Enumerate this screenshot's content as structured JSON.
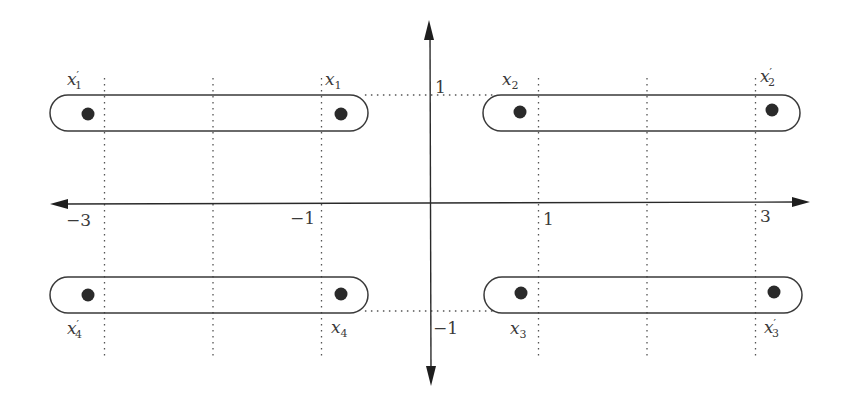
{
  "diagram": {
    "type": "coordinate-plane-pairing",
    "axes": {
      "x_ticks": [
        {
          "value": -3,
          "label": "−3"
        },
        {
          "value": -1,
          "label": "−1"
        },
        {
          "value": 1,
          "label": "1"
        },
        {
          "value": 3,
          "label": "3"
        }
      ],
      "y_ticks": [
        {
          "value": 1,
          "label": "1"
        },
        {
          "value": -1,
          "label": "−1"
        }
      ],
      "x_range": [
        -3.5,
        3.5
      ],
      "y_range": [
        -1.7,
        1.7
      ]
    },
    "dotted_verticals_x": [
      -3,
      -2,
      -1,
      1,
      2,
      3
    ],
    "points": [
      {
        "id": "x1p",
        "name": "x",
        "sub": "1",
        "prime": true,
        "x": -3.2,
        "y": 0.8,
        "label_pos": "above"
      },
      {
        "id": "x1",
        "name": "x",
        "sub": "1",
        "prime": false,
        "x": -0.8,
        "y": 0.8,
        "label_pos": "above"
      },
      {
        "id": "x2",
        "name": "x",
        "sub": "2",
        "prime": false,
        "x": 0.8,
        "y": 0.8,
        "label_pos": "above"
      },
      {
        "id": "x2p",
        "name": "x",
        "sub": "2",
        "prime": true,
        "x": 3.1,
        "y": 0.8,
        "label_pos": "above"
      },
      {
        "id": "x3",
        "name": "x",
        "sub": "3",
        "prime": false,
        "x": 0.8,
        "y": -0.8,
        "label_pos": "below"
      },
      {
        "id": "x3p",
        "name": "x",
        "sub": "3",
        "prime": true,
        "x": 3.1,
        "y": -0.8,
        "label_pos": "below"
      },
      {
        "id": "x4",
        "name": "x",
        "sub": "4",
        "prime": false,
        "x": -0.8,
        "y": -0.8,
        "label_pos": "below"
      },
      {
        "id": "x4p",
        "name": "x",
        "sub": "4",
        "prime": true,
        "x": -3.2,
        "y": -0.8,
        "label_pos": "below"
      }
    ],
    "pairs": [
      {
        "from": "x1p",
        "to": "x1"
      },
      {
        "from": "x2",
        "to": "x2p"
      },
      {
        "from": "x3",
        "to": "x3p"
      },
      {
        "from": "x4p",
        "to": "x4"
      }
    ],
    "guide_lines": [
      {
        "y": 1,
        "from_x": -0.6,
        "to_x": 0.6
      },
      {
        "y": -1,
        "from_x": -0.6,
        "to_x": 0.6
      }
    ]
  }
}
